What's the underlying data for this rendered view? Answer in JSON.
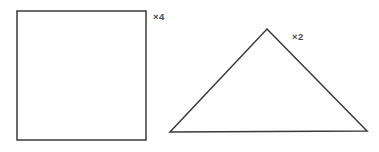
{
  "canvas": {
    "width": 379,
    "height": 152,
    "background_color": "#ffffff"
  },
  "figure": {
    "stroke_color": "#3a3a3a",
    "label_color": "#4a4a4a",
    "shapes": [
      {
        "name": "square",
        "label": "×4",
        "multiplier": 4,
        "vertices": [
          [
            17,
            11
          ],
          [
            146,
            11
          ],
          [
            146,
            140
          ],
          [
            17,
            140
          ]
        ],
        "label_position": [
          153,
          12
        ]
      },
      {
        "name": "triangle",
        "label": "×2",
        "multiplier": 2,
        "vertices": [
          [
            267,
            29
          ],
          [
            367,
            131
          ],
          [
            170,
            132
          ]
        ],
        "label_position": [
          292,
          32
        ]
      }
    ]
  }
}
